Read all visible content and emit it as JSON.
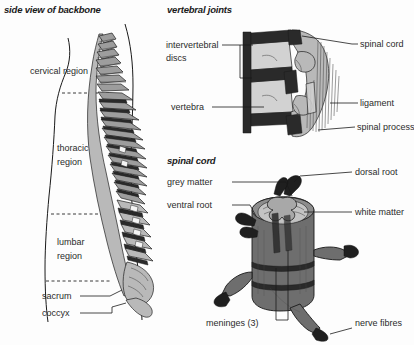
{
  "figure": {
    "background_color": "#fdfdfd",
    "ink_color": "#1a1a1a",
    "panels": [
      {
        "id": "backbone",
        "title": "side view of backbone"
      },
      {
        "id": "vertebral-joints",
        "title": "vertebral joints"
      },
      {
        "id": "spinal-cord",
        "title": "spinal cord"
      }
    ]
  },
  "backbone_panel": {
    "title": "side view of backbone",
    "regions": [
      {
        "key": "cervical",
        "label": "cervical region"
      },
      {
        "key": "thoracic",
        "label_line1": "thoracic",
        "label_line2": "region"
      },
      {
        "key": "lumbar",
        "label_line1": "lumbar",
        "label_line2": "region"
      }
    ],
    "parts": [
      {
        "key": "sacrum",
        "label": "sacrum"
      },
      {
        "key": "coccyx",
        "label": "coccyx"
      }
    ]
  },
  "vertebral_joints_panel": {
    "title": "vertebral joints",
    "labels_left": [
      {
        "key": "intervertebral-discs",
        "line1": "intervertebral",
        "line2": "discs"
      },
      {
        "key": "vertebra",
        "line1": "vertebra"
      }
    ],
    "labels_right": [
      {
        "key": "spinal-cord",
        "text": "spinal cord"
      },
      {
        "key": "ligament",
        "text": "ligament"
      },
      {
        "key": "spinal-process",
        "text": "spinal  process"
      }
    ]
  },
  "spinal_cord_panel": {
    "title": "spinal cord",
    "labels_left": [
      {
        "key": "grey-matter",
        "text": "grey matter"
      },
      {
        "key": "ventral-root",
        "text": "ventral root"
      }
    ],
    "labels_right": [
      {
        "key": "dorsal-root",
        "text": "dorsal root"
      },
      {
        "key": "white-matter",
        "text": "white matter"
      },
      {
        "key": "nerve-fibres",
        "text": "nerve fibres"
      }
    ],
    "labels_bottom": [
      {
        "key": "meninges",
        "text": "meninges (3)"
      }
    ]
  }
}
